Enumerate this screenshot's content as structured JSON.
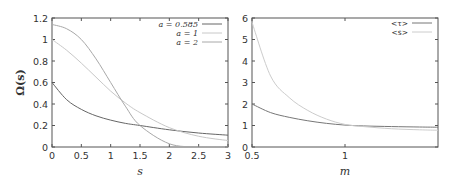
{
  "chart_data": [
    {
      "type": "line",
      "title": "",
      "xlabel": "s",
      "ylabel": "Ω(s)",
      "xlim": [
        0,
        3
      ],
      "ylim": [
        0,
        1.2
      ],
      "xticks": [
        "0",
        "0.5",
        "1",
        "1.5",
        "2",
        "2.5",
        "3"
      ],
      "yticks": [
        "0",
        "0.2",
        "0.4",
        "0.6",
        "0.8",
        "1",
        "1.2"
      ],
      "grid": false,
      "legend_position": "top-right",
      "x": [
        0,
        0.25,
        0.5,
        0.75,
        1,
        1.25,
        1.5,
        2,
        2.5,
        3
      ],
      "series": [
        {
          "name": "a = 0.585",
          "color": "#666666",
          "values": [
            0.6,
            0.44,
            0.35,
            0.29,
            0.25,
            0.22,
            0.2,
            0.16,
            0.13,
            0.11
          ]
        },
        {
          "name": "a = 1",
          "color": "#c8c8c8",
          "values": [
            1.0,
            0.9,
            0.78,
            0.65,
            0.52,
            0.41,
            0.32,
            0.18,
            0.1,
            0.06
          ]
        },
        {
          "name": "a = 2",
          "color": "#a8a8a8",
          "values": [
            1.14,
            1.1,
            1.0,
            0.82,
            0.6,
            0.38,
            0.2,
            0.03,
            0.0,
            0.0
          ]
        }
      ]
    },
    {
      "type": "line",
      "title": "",
      "xlabel": "m",
      "ylabel": "",
      "xlim": [
        0.5,
        1.5
      ],
      "ylim": [
        0,
        6
      ],
      "xticks": [
        "0.5",
        "1"
      ],
      "yticks": [
        "0",
        "1",
        "2",
        "3",
        "4",
        "5",
        "6"
      ],
      "grid": false,
      "legend_position": "top-right",
      "x": [
        0.5,
        0.6,
        0.7,
        0.8,
        0.9,
        1.0,
        1.1,
        1.25,
        1.4,
        1.5
      ],
      "series": [
        {
          "name": "<τ>",
          "color": "#777777",
          "values": [
            2.0,
            1.6,
            1.38,
            1.22,
            1.1,
            1.02,
            0.98,
            0.95,
            0.93,
            0.92
          ]
        },
        {
          "name": "<s>",
          "color": "#cccccc",
          "values": [
            5.8,
            3.3,
            2.3,
            1.7,
            1.3,
            1.05,
            0.95,
            0.85,
            0.8,
            0.78
          ]
        }
      ]
    }
  ],
  "labels": {
    "left_xlabel": "s",
    "left_ylabel": "Ω(s)",
    "right_xlabel": "m",
    "left_legend": [
      "a = 0.585",
      "a = 1",
      "a = 2"
    ],
    "right_legend": [
      "<τ>",
      "<s>"
    ]
  }
}
